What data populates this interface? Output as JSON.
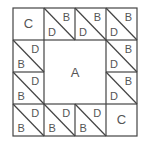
{
  "diagram": {
    "grid": {
      "cols": 4,
      "rows": 4,
      "x0": 13,
      "y0": 8,
      "cell_w": 31,
      "cell_h": 32
    },
    "line_color": "#444444",
    "text_color": "#555555",
    "center": {
      "label": "A",
      "col": 1,
      "row": 1,
      "span": 2
    },
    "corners": [
      {
        "label": "C",
        "col": 0,
        "row": 0
      },
      {
        "label": "C",
        "col": 3,
        "row": 3
      }
    ],
    "triangles": [
      {
        "col": 1,
        "row": 0,
        "upper_right": "B",
        "lower_left": "D"
      },
      {
        "col": 2,
        "row": 0,
        "upper_right": "B",
        "lower_left": "D"
      },
      {
        "col": 3,
        "row": 0,
        "upper_right": "B",
        "lower_left": "D"
      },
      {
        "col": 0,
        "row": 1,
        "upper_right": "D",
        "lower_left": "B"
      },
      {
        "col": 3,
        "row": 1,
        "upper_right": "B",
        "lower_left": "D"
      },
      {
        "col": 0,
        "row": 2,
        "upper_right": "D",
        "lower_left": "B"
      },
      {
        "col": 3,
        "row": 2,
        "upper_right": "B",
        "lower_left": "D"
      },
      {
        "col": 0,
        "row": 3,
        "upper_right": "D",
        "lower_left": "B"
      },
      {
        "col": 1,
        "row": 3,
        "upper_right": "D",
        "lower_left": "B"
      },
      {
        "col": 2,
        "row": 3,
        "upper_right": "D",
        "lower_left": "B"
      }
    ]
  }
}
